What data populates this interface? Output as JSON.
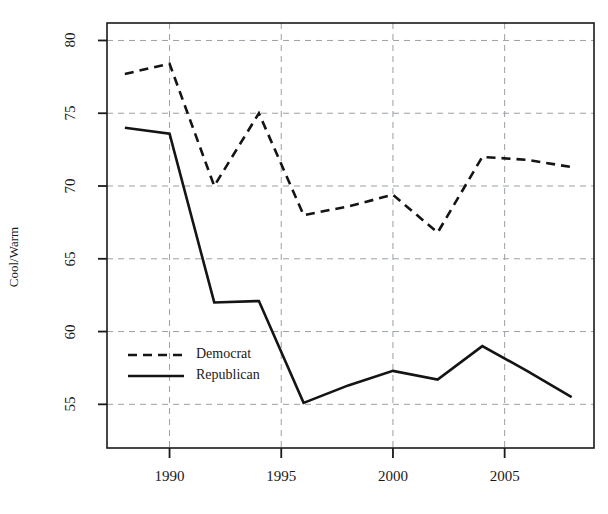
{
  "chart_data": {
    "type": "line",
    "title": "",
    "xlabel": "",
    "ylabel": "Cool/Warm",
    "xlim": [
      1987.2,
      2009.0
    ],
    "ylim": [
      52.0,
      81.2
    ],
    "grid": true,
    "grid_style": "dashed",
    "legend_position": "center-left",
    "x": [
      1988,
      1990,
      1992,
      1994,
      1996,
      1998,
      2000,
      2002,
      2004,
      2006,
      2008
    ],
    "xticks": [
      1990,
      1995,
      2000,
      2005
    ],
    "xtick_labels": [
      "1990",
      "1995",
      "2000",
      "2005"
    ],
    "yticks": [
      55,
      60,
      65,
      70,
      75,
      80
    ],
    "ytick_labels": [
      "55",
      "60",
      "65",
      "70",
      "75",
      "80"
    ],
    "series": [
      {
        "name": "Democrat",
        "style": "dashed",
        "color": "#141414",
        "values": [
          77.7,
          78.4,
          70.0,
          75.0,
          68.0,
          68.6,
          69.4,
          66.8,
          72.0,
          71.8,
          71.3
        ]
      },
      {
        "name": "Republican",
        "style": "solid",
        "color": "#141414",
        "values": [
          74.0,
          73.6,
          62.0,
          62.1,
          55.1,
          56.3,
          57.3,
          56.7,
          59.0,
          57.3,
          55.5
        ]
      }
    ]
  },
  "legend": {
    "items": [
      {
        "label": "Democrat",
        "style": "dashed"
      },
      {
        "label": "Republican",
        "style": "solid"
      }
    ]
  },
  "axes": {
    "y_axis_title": "Cool/Warm"
  }
}
